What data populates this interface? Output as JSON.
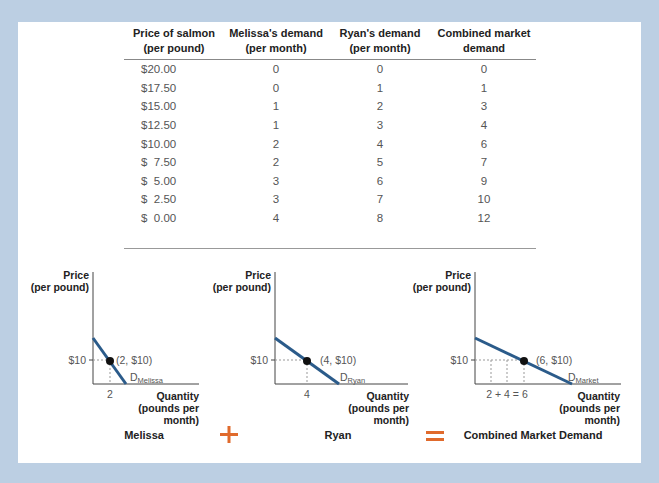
{
  "table": {
    "headers": [
      [
        "Price of salmon",
        "(per pound)"
      ],
      [
        "Melissa's demand",
        "(per month)"
      ],
      [
        "Ryan's demand",
        "(per month)"
      ],
      [
        "Combined market",
        "demand"
      ]
    ],
    "rows": [
      [
        "$20.00",
        "0",
        "0",
        "0"
      ],
      [
        "$17.50",
        "0",
        "1",
        "1"
      ],
      [
        "$15.00",
        "1",
        "2",
        "3"
      ],
      [
        "$12.50",
        "1",
        "3",
        "4"
      ],
      [
        "$10.00",
        "2",
        "4",
        "6"
      ],
      [
        "$  7.50",
        "2",
        "5",
        "7"
      ],
      [
        "$  5.00",
        "3",
        "6",
        "9"
      ],
      [
        "$  2.50",
        "3",
        "7",
        "10"
      ],
      [
        "$  0.00",
        "4",
        "8",
        "12"
      ]
    ]
  },
  "graphs": {
    "y_label_1": "Price",
    "y_label_2": "(per pound)",
    "x_label_1": "Quantity",
    "x_label_2": "(pounds per",
    "x_label_3": "month)",
    "price_tick": "$10",
    "melissa": {
      "title": "Melissa",
      "point": "(2, $10)",
      "x_tick": "2",
      "curve": "D",
      "curve_sub": "Melissa"
    },
    "ryan": {
      "title": "Ryan",
      "point": "(4, $10)",
      "x_tick": "4",
      "curve": "D",
      "curve_sub": "Ryan"
    },
    "market": {
      "title": "Combined Market Demand",
      "point": "(6, $10)",
      "x_tick": "2 + 4 = 6",
      "curve": "D",
      "curve_sub": "Market"
    },
    "plus": "+",
    "equals": "="
  },
  "colors": {
    "curve": "#2b5b8a",
    "operator": "#e06a2c",
    "frame": "#bccfe3"
  },
  "chart_data": [
    {
      "type": "table",
      "title": "Demand for salmon",
      "columns": [
        "Price of salmon (per pound)",
        "Melissa's demand (per month)",
        "Ryan's demand (per month)",
        "Combined market demand"
      ],
      "x": [
        20.0,
        17.5,
        15.0,
        12.5,
        10.0,
        7.5,
        5.0,
        2.5,
        0.0
      ],
      "series": [
        {
          "name": "Melissa's demand",
          "values": [
            0,
            0,
            1,
            1,
            2,
            2,
            3,
            3,
            4
          ]
        },
        {
          "name": "Ryan's demand",
          "values": [
            0,
            1,
            2,
            3,
            4,
            5,
            6,
            7,
            8
          ]
        },
        {
          "name": "Combined market demand",
          "values": [
            0,
            1,
            3,
            4,
            6,
            7,
            9,
            10,
            12
          ]
        }
      ]
    },
    {
      "type": "line",
      "title": "Melissa",
      "xlabel": "Quantity (pounds per month)",
      "ylabel": "Price (per pound)",
      "series": [
        {
          "name": "D Melissa",
          "points": [
            [
              2,
              10
            ]
          ]
        }
      ],
      "annotations": [
        "(2, $10)"
      ],
      "x_ticks": [
        "2"
      ],
      "y_ticks": [
        "$10"
      ]
    },
    {
      "type": "line",
      "title": "Ryan",
      "xlabel": "Quantity (pounds per month)",
      "ylabel": "Price (per pound)",
      "series": [
        {
          "name": "D Ryan",
          "points": [
            [
              4,
              10
            ]
          ]
        }
      ],
      "annotations": [
        "(4, $10)"
      ],
      "x_ticks": [
        "4"
      ],
      "y_ticks": [
        "$10"
      ]
    },
    {
      "type": "line",
      "title": "Combined Market Demand",
      "xlabel": "Quantity (pounds per month)",
      "ylabel": "Price (per pound)",
      "series": [
        {
          "name": "D Market",
          "points": [
            [
              6,
              10
            ]
          ]
        }
      ],
      "annotations": [
        "(6, $10)"
      ],
      "x_ticks": [
        "2 + 4 = 6"
      ],
      "y_ticks": [
        "$10"
      ]
    }
  ]
}
